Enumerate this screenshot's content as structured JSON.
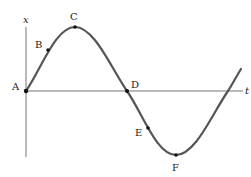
{
  "diagram": {
    "type": "sine-wave",
    "axes": {
      "vertical_label": "x",
      "horizontal_label": "t"
    },
    "points": [
      {
        "id": "A",
        "label": "A",
        "x": 26,
        "y": 91,
        "label_x": 12,
        "label_y": 91
      },
      {
        "id": "B",
        "label": "B",
        "x": 48,
        "y": 50,
        "label_x": 35,
        "label_y": 48
      },
      {
        "id": "C",
        "label": "C",
        "x": 75,
        "y": 27,
        "label_x": 70,
        "label_y": 17
      },
      {
        "id": "D",
        "label": "D",
        "x": 127,
        "y": 91,
        "label_x": 132,
        "label_y": 87
      },
      {
        "id": "E",
        "label": "E",
        "x": 148,
        "y": 128,
        "label_x": 135,
        "label_y": 135
      },
      {
        "id": "F",
        "label": "F",
        "x": 176,
        "y": 155,
        "label_x": 172,
        "label_y": 171
      }
    ],
    "colors": {
      "curve": "#555555",
      "axis": "#777777",
      "point": "#111111"
    }
  }
}
